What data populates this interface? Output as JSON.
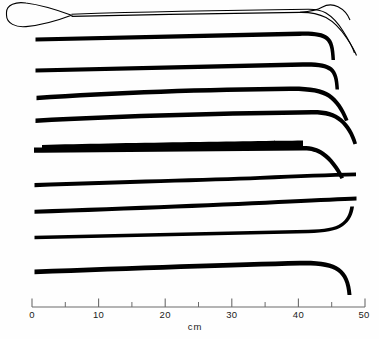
{
  "figure": {
    "title": "",
    "background_color": "#fefefe",
    "ink_color": "#000000",
    "width": 379,
    "height": 339
  },
  "scale": {
    "unit_label": "cm",
    "axis_color": "#5a5a5a",
    "tick_labels": [
      "0",
      "10",
      "20",
      "30",
      "40",
      "50"
    ],
    "tick_values": [
      0,
      10,
      20,
      30,
      40,
      50
    ],
    "minor_tick_values": [
      5,
      15,
      25,
      35,
      45
    ],
    "axis_min": 0,
    "axis_max": 50,
    "px_per_cm": 6.66,
    "origin_px": 32,
    "baseline_y_px": 307
  },
  "instruments": [
    {
      "index": 1,
      "name": "loop-handled probe",
      "style": "outline",
      "length_cm": 50.0,
      "tip": "down-curved taper",
      "left_feature": "teardrop loop handle",
      "y_px": 15
    },
    {
      "index": 2,
      "name": "rod-with-hooked-tip-1",
      "style": "solid",
      "length_cm": 45.2,
      "tip": "sharp downward hook",
      "left_feature": "blunt squared end",
      "y_px": 33
    },
    {
      "index": 3,
      "name": "rod-with-hooked-tip-2",
      "style": "solid",
      "length_cm": 45.6,
      "tip": "sharp downward hook",
      "left_feature": "blunt squared end",
      "y_px": 64
    },
    {
      "index": 4,
      "name": "rod-with-hooked-tip-3",
      "style": "solid",
      "length_cm": 46.2,
      "tip": "downward hook",
      "left_feature": "blunt squared end",
      "y_px": 90
    },
    {
      "index": 5,
      "name": "rod-with-angled-tip-1",
      "style": "solid",
      "length_cm": 46.8,
      "tip": "gentle oblique bend",
      "left_feature": "blunt squared end",
      "y_px": 114
    },
    {
      "index": 6,
      "name": "stepped-rod-with-angled-tip",
      "style": "solid",
      "length_cm": 45.5,
      "tip": "oblique bend after shoulder",
      "left_feature": "stepped shoulder near handle",
      "y_px": 145
    },
    {
      "index": 7,
      "name": "straight-rod-1",
      "style": "solid",
      "length_cm": 47.0,
      "tip": "blunt straight end",
      "left_feature": "blunt squared end",
      "y_px": 180
    },
    {
      "index": 8,
      "name": "straight-rod-2",
      "style": "solid",
      "length_cm": 47.2,
      "tip": "blunt straight end",
      "left_feature": "blunt squared end",
      "y_px": 206
    },
    {
      "index": 9,
      "name": "rod-with-rounded-hook-1",
      "style": "solid",
      "length_cm": 47.5,
      "tip": "rounded downward hook",
      "left_feature": "blunt squared end",
      "y_px": 236
    },
    {
      "index": 10,
      "name": "rod-with-rounded-hook-2",
      "style": "solid",
      "length_cm": 46.5,
      "tip": "long rounded downward hook",
      "left_feature": "blunt squared end",
      "y_px": 266
    }
  ]
}
